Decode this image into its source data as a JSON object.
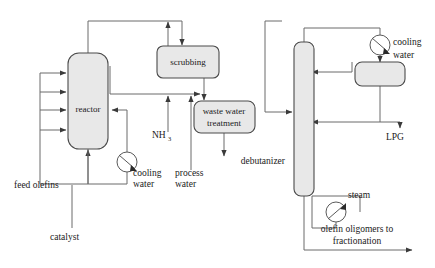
{
  "diagram": {
    "background_color": "#ffffff",
    "vessel_fill": "#e8e8e8",
    "vessel_stroke": "#4a4a4a",
    "pipe_stroke": "#6b6b6b"
  },
  "units": {
    "reactor": "reactor",
    "scrubbing": "scrubbing",
    "waste_water_treatment_line1": "waste water",
    "waste_water_treatment_line2": "treatment",
    "debutanizer": "debutanizer",
    "reflux_drum": ""
  },
  "streams": {
    "feed_olefins": "feed olefins",
    "catalyst": "catalyst",
    "cooling_water_reactor_line1": "cooling",
    "cooling_water_reactor_line2": "water",
    "ammonia_main": "NH",
    "ammonia_sub": "3",
    "process_water_line1": "process",
    "process_water_line2": "water",
    "cooling_water_condenser_line1": "cooling",
    "cooling_water_condenser_line2": "water",
    "lpg": "LPG",
    "steam": "steam",
    "olefin_oligomers_line1": "olefin oligomers to",
    "olefin_oligomers_line2": "fractionation"
  },
  "icons": {
    "heat_exchanger_reactor": "heat-exchanger-icon",
    "heat_exchanger_condenser": "heat-exchanger-icon",
    "heat_exchanger_reboiler": "heat-exchanger-icon"
  }
}
